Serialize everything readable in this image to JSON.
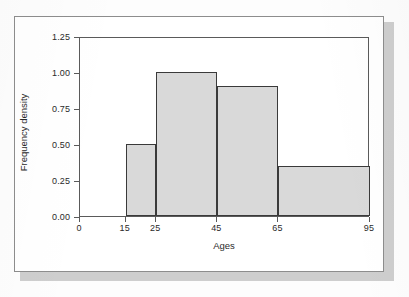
{
  "chart_data": {
    "type": "bar",
    "title": "",
    "subtitle": "",
    "xlabel": "Ages",
    "ylabel": "Frequency density",
    "xlim": [
      0,
      95
    ],
    "ylim": [
      0.0,
      1.25
    ],
    "grid": false,
    "legend": null,
    "x_ticks": [
      {
        "value": 0,
        "label": "0"
      },
      {
        "value": 15,
        "label": "15"
      },
      {
        "value": 25,
        "label": "25"
      },
      {
        "value": 45,
        "label": "45"
      },
      {
        "value": 65,
        "label": "65"
      },
      {
        "value": 95,
        "label": "95"
      }
    ],
    "y_ticks": [
      {
        "value": 0.0,
        "label": "0.00"
      },
      {
        "value": 0.25,
        "label": "0.25"
      },
      {
        "value": 0.5,
        "label": "0.50"
      },
      {
        "value": 0.75,
        "label": "0.75"
      },
      {
        "value": 1.0,
        "label": "1.00"
      },
      {
        "value": 1.25,
        "label": "1.25"
      }
    ],
    "bins": [
      {
        "label": "15-25",
        "x0": 15,
        "x1": 25,
        "value": 0.5
      },
      {
        "label": "25-45",
        "x0": 25,
        "x1": 45,
        "value": 1.0
      },
      {
        "label": "45-65",
        "x0": 45,
        "x1": 65,
        "value": 0.9
      },
      {
        "label": "65-95",
        "x0": 65,
        "x1": 95,
        "value": 0.35
      }
    ],
    "categories": [
      "15-25",
      "25-45",
      "45-65",
      "65-95"
    ],
    "values": [
      0.5,
      1.0,
      0.9,
      0.35
    ],
    "colors": {
      "bar_fill": "#d9d9d9",
      "bar_edge": "#3a3a3a",
      "axis": "#5a5a5a",
      "text": "#2a2a2a",
      "frame": "#8d8d8d",
      "page": "#fdfdfd",
      "shadow": "#bdbdbd"
    }
  }
}
